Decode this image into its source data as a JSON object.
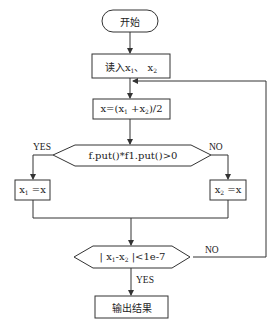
{
  "diagram": {
    "type": "flowchart",
    "nodes": {
      "start": {
        "shape": "terminal",
        "text": "开始"
      },
      "read": {
        "shape": "process",
        "text_prefix": "读入x",
        "sub1": "1",
        "sep": "、 x",
        "sub2": "2"
      },
      "midpoint": {
        "shape": "process",
        "text_a": "x=(x",
        "sub1": "1",
        "text_b": " +x",
        "sub2": "2",
        "text_c": ")/2"
      },
      "decision1": {
        "shape": "decision",
        "text": "f.put()*f1.put()>0"
      },
      "assign_x1": {
        "shape": "process",
        "text_a": "x",
        "sub": "1",
        "text_b": " =x"
      },
      "assign_x2": {
        "shape": "process",
        "text_a": "x",
        "sub": "2",
        "text_b": " =x"
      },
      "decision2": {
        "shape": "decision",
        "text_a": "| x",
        "sub1": "1",
        "text_b": "-x",
        "sub2": "2",
        "text_c": " |<1e-7"
      },
      "output": {
        "shape": "process",
        "text": "输出结果"
      }
    },
    "labels": {
      "d1_yes": "YES",
      "d1_no": "NO",
      "d2_no": "NO",
      "d2_yes": "YES"
    },
    "edges": [
      {
        "from": "start",
        "to": "read"
      },
      {
        "from": "read",
        "to": "midpoint"
      },
      {
        "from": "midpoint",
        "to": "decision1"
      },
      {
        "from": "decision1",
        "to": "assign_x1",
        "label": "YES"
      },
      {
        "from": "decision1",
        "to": "assign_x2",
        "label": "NO"
      },
      {
        "from": "assign_x1",
        "to": "decision2"
      },
      {
        "from": "assign_x2",
        "to": "decision2"
      },
      {
        "from": "decision2",
        "to": "midpoint",
        "label": "NO"
      },
      {
        "from": "decision2",
        "to": "output",
        "label": "YES"
      }
    ],
    "colors": {
      "stroke": "#333333",
      "background": "#ffffff",
      "text": "#222222"
    }
  }
}
